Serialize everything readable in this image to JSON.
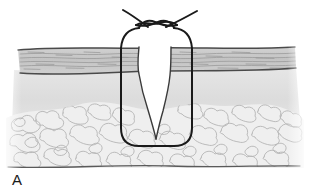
{
  "figure": {
    "panel_label": "A",
    "width": 309,
    "height": 196
  },
  "colors": {
    "background": "#ffffff",
    "ink": "#2b2b2b",
    "suture_thread": "#1a1a1a",
    "epidermis_fill": "#c9c9c9",
    "epidermis_hatch": "#8f8f8f",
    "dermis_fill": "#e2e2e2",
    "fat_fill": "#ededed",
    "fat_outline": "#b0b0b0",
    "wound_gap_fill": "#ffffff",
    "baseline": "#5a5a5a"
  },
  "anatomy": {
    "layers": [
      {
        "id": "epidermis",
        "label": "epidermis",
        "top_y": 48,
        "bottom_y": 74,
        "fill": "#c9c9c9",
        "texture": "horizontal-wavy-hatch"
      },
      {
        "id": "dermis",
        "label": "dermis",
        "top_y": 74,
        "bottom_y": 112,
        "fill": "#e2e2e2",
        "texture": "smooth-gradient"
      },
      {
        "id": "subcutaneous-fat",
        "label": "subcutaneous fat",
        "top_y": 108,
        "bottom_y": 168,
        "fill": "#ededed",
        "texture": "lobular-cells"
      }
    ],
    "wound": {
      "label": "wound gap",
      "shape": "tapering-V",
      "surface_left_x": 139,
      "surface_right_x": 172,
      "apex_x": 155,
      "apex_y": 139,
      "fill": "#ffffff"
    },
    "baseline": {
      "label": "deep fascia baseline",
      "y": 166,
      "from_x": 8,
      "to_x": 300
    }
  },
  "suture": {
    "label": "simple interrupted suture",
    "loop": {
      "left_x": 121,
      "right_x": 192,
      "top_y": 32,
      "bottom_y": 146,
      "corner_radius": 16
    },
    "knot": {
      "label": "square knot",
      "center_x": 156,
      "center_y": 24,
      "crossings": 2
    },
    "tails": [
      {
        "id": "tail-left",
        "from_x": 124,
        "from_y": 11,
        "to_x": 148,
        "to_y": 27
      },
      {
        "id": "tail-right",
        "from_x": 196,
        "from_y": 12,
        "to_x": 166,
        "to_y": 27
      }
    ]
  }
}
